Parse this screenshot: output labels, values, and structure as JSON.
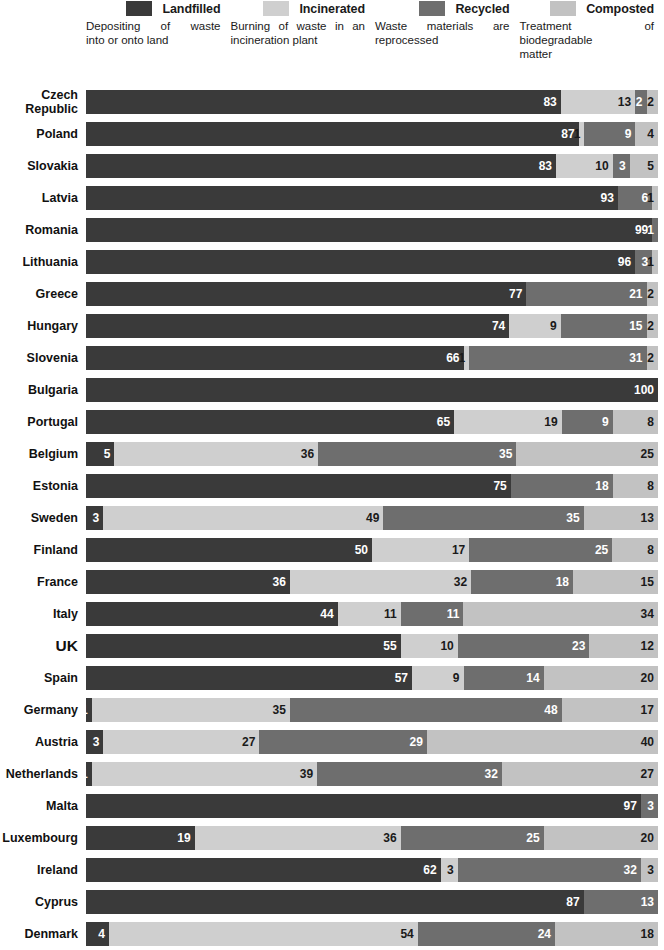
{
  "legend": {
    "items": [
      {
        "key": "landfilled",
        "label": "Landfilled",
        "color": "#3a3a3a",
        "desc_lines": [
          "Depositing of waste",
          "into or onto land"
        ]
      },
      {
        "key": "incinerated",
        "label": "Incinerated",
        "color": "#cfcfcf",
        "desc_lines": [
          "Burning of waste in an",
          "incineration plant"
        ]
      },
      {
        "key": "recycled",
        "label": "Recycled",
        "color": "#6e6e6e",
        "desc_lines": [
          "Waste materials are",
          "reprocessed"
        ]
      },
      {
        "key": "composted",
        "label": "Composted",
        "color": "#c2c2c2",
        "desc_lines": [
          "Treatment of",
          "biodegradable",
          "matter"
        ]
      }
    ]
  },
  "chart_data": {
    "type": "bar",
    "orientation": "horizontal",
    "stacked": true,
    "title": "",
    "xlabel": "",
    "ylabel": "",
    "xlim": [
      0,
      100
    ],
    "unit": "percent",
    "grid": false,
    "legend_position": "top",
    "series": [
      {
        "name": "Landfilled",
        "color": "#3a3a3a"
      },
      {
        "name": "Incinerated",
        "color": "#cfcfcf"
      },
      {
        "name": "Recycled",
        "color": "#6e6e6e"
      },
      {
        "name": "Composted",
        "color": "#c2c2c2"
      }
    ],
    "categories": [
      "Czech Republic",
      "Poland",
      "Slovakia",
      "Latvia",
      "Romania",
      "Lithuania",
      "Greece",
      "Hungary",
      "Slovenia",
      "Bulgaria",
      "Portugal",
      "Belgium",
      "Estonia",
      "Sweden",
      "Finland",
      "France",
      "Italy",
      "UK",
      "Spain",
      "Germany",
      "Austria",
      "Netherlands",
      "Malta",
      "Luxembourg",
      "Ireland",
      "Cyprus",
      "Denmark"
    ],
    "rows": [
      {
        "label": "Czech\nRepublic",
        "emphasis": false,
        "segments": [
          {
            "series": "Landfilled",
            "value": 83
          },
          {
            "series": "Incinerated",
            "value": 13
          },
          {
            "series": "Recycled",
            "value": 2
          },
          {
            "series": "Composted",
            "value": 2
          }
        ]
      },
      {
        "label": "Poland",
        "emphasis": false,
        "segments": [
          {
            "series": "Landfilled",
            "value": 87
          },
          {
            "series": "Incinerated",
            "value": 1
          },
          {
            "series": "Recycled",
            "value": 9
          },
          {
            "series": "Composted",
            "value": 4
          }
        ]
      },
      {
        "label": "Slovakia",
        "emphasis": false,
        "segments": [
          {
            "series": "Landfilled",
            "value": 83
          },
          {
            "series": "Incinerated",
            "value": 10
          },
          {
            "series": "Recycled",
            "value": 3
          },
          {
            "series": "Composted",
            "value": 5
          }
        ]
      },
      {
        "label": "Latvia",
        "emphasis": false,
        "segments": [
          {
            "series": "Landfilled",
            "value": 93
          },
          {
            "series": "Recycled",
            "value": 6
          },
          {
            "series": "Composted",
            "value": 1
          }
        ]
      },
      {
        "label": "Romania",
        "emphasis": false,
        "segments": [
          {
            "series": "Landfilled",
            "value": 99
          },
          {
            "series": "Recycled",
            "value": 1
          }
        ]
      },
      {
        "label": "Lithuania",
        "emphasis": false,
        "segments": [
          {
            "series": "Landfilled",
            "value": 96
          },
          {
            "series": "Recycled",
            "value": 3
          },
          {
            "series": "Composted",
            "value": 1
          }
        ]
      },
      {
        "label": "Greece",
        "emphasis": false,
        "segments": [
          {
            "series": "Landfilled",
            "value": 77
          },
          {
            "series": "Recycled",
            "value": 21
          },
          {
            "series": "Composted",
            "value": 2
          }
        ]
      },
      {
        "label": "Hungary",
        "emphasis": false,
        "segments": [
          {
            "series": "Landfilled",
            "value": 74
          },
          {
            "series": "Incinerated",
            "value": 9
          },
          {
            "series": "Recycled",
            "value": 15
          },
          {
            "series": "Composted",
            "value": 2
          }
        ]
      },
      {
        "label": "Slovenia",
        "emphasis": false,
        "segments": [
          {
            "series": "Landfilled",
            "value": 66
          },
          {
            "series": "Incinerated",
            "value": 1
          },
          {
            "series": "Recycled",
            "value": 31
          },
          {
            "series": "Composted",
            "value": 2
          }
        ]
      },
      {
        "label": "Bulgaria",
        "emphasis": false,
        "segments": [
          {
            "series": "Landfilled",
            "value": 100
          }
        ]
      },
      {
        "label": "Portugal",
        "emphasis": false,
        "segments": [
          {
            "series": "Landfilled",
            "value": 65
          },
          {
            "series": "Incinerated",
            "value": 19
          },
          {
            "series": "Recycled",
            "value": 9
          },
          {
            "series": "Composted",
            "value": 8
          }
        ]
      },
      {
        "label": "Belgium",
        "emphasis": false,
        "segments": [
          {
            "series": "Landfilled",
            "value": 5
          },
          {
            "series": "Incinerated",
            "value": 36
          },
          {
            "series": "Recycled",
            "value": 35
          },
          {
            "series": "Composted",
            "value": 25
          }
        ]
      },
      {
        "label": "Estonia",
        "emphasis": false,
        "segments": [
          {
            "series": "Landfilled",
            "value": 75
          },
          {
            "series": "Recycled",
            "value": 18
          },
          {
            "series": "Composted",
            "value": 8
          }
        ]
      },
      {
        "label": "Sweden",
        "emphasis": false,
        "segments": [
          {
            "series": "Landfilled",
            "value": 3
          },
          {
            "series": "Incinerated",
            "value": 49
          },
          {
            "series": "Recycled",
            "value": 35
          },
          {
            "series": "Composted",
            "value": 13
          }
        ]
      },
      {
        "label": "Finland",
        "emphasis": false,
        "segments": [
          {
            "series": "Landfilled",
            "value": 50
          },
          {
            "series": "Incinerated",
            "value": 17
          },
          {
            "series": "Recycled",
            "value": 25
          },
          {
            "series": "Composted",
            "value": 8
          }
        ]
      },
      {
        "label": "France",
        "emphasis": false,
        "segments": [
          {
            "series": "Landfilled",
            "value": 36
          },
          {
            "series": "Incinerated",
            "value": 32
          },
          {
            "series": "Recycled",
            "value": 18
          },
          {
            "series": "Composted",
            "value": 15
          }
        ]
      },
      {
        "label": "Italy",
        "emphasis": false,
        "segments": [
          {
            "series": "Landfilled",
            "value": 44
          },
          {
            "series": "Incinerated",
            "value": 11
          },
          {
            "series": "Recycled",
            "value": 11
          },
          {
            "series": "Composted",
            "value": 34
          }
        ]
      },
      {
        "label": "UK",
        "emphasis": true,
        "segments": [
          {
            "series": "Landfilled",
            "value": 55
          },
          {
            "series": "Incinerated",
            "value": 10
          },
          {
            "series": "Recycled",
            "value": 23
          },
          {
            "series": "Composted",
            "value": 12
          }
        ]
      },
      {
        "label": "Spain",
        "emphasis": false,
        "segments": [
          {
            "series": "Landfilled",
            "value": 57
          },
          {
            "series": "Incinerated",
            "value": 9
          },
          {
            "series": "Recycled",
            "value": 14
          },
          {
            "series": "Composted",
            "value": 20
          }
        ]
      },
      {
        "label": "Germany",
        "emphasis": false,
        "segments": [
          {
            "series": "Landfilled",
            "value": 1
          },
          {
            "series": "Incinerated",
            "value": 35
          },
          {
            "series": "Recycled",
            "value": 48
          },
          {
            "series": "Composted",
            "value": 17
          }
        ]
      },
      {
        "label": "Austria",
        "emphasis": false,
        "segments": [
          {
            "series": "Landfilled",
            "value": 3
          },
          {
            "series": "Incinerated",
            "value": 27
          },
          {
            "series": "Recycled",
            "value": 29
          },
          {
            "series": "Composted",
            "value": 40
          }
        ]
      },
      {
        "label": "Netherlands",
        "emphasis": false,
        "segments": [
          {
            "series": "Landfilled",
            "value": 1
          },
          {
            "series": "Incinerated",
            "value": 39
          },
          {
            "series": "Recycled",
            "value": 32
          },
          {
            "series": "Composted",
            "value": 27
          }
        ]
      },
      {
        "label": "Malta",
        "emphasis": false,
        "segments": [
          {
            "series": "Landfilled",
            "value": 97
          },
          {
            "series": "Recycled",
            "value": 3
          }
        ]
      },
      {
        "label": "Luxembourg",
        "emphasis": false,
        "segments": [
          {
            "series": "Landfilled",
            "value": 19
          },
          {
            "series": "Incinerated",
            "value": 36
          },
          {
            "series": "Recycled",
            "value": 25
          },
          {
            "series": "Composted",
            "value": 20
          }
        ]
      },
      {
        "label": "Ireland",
        "emphasis": false,
        "segments": [
          {
            "series": "Landfilled",
            "value": 62
          },
          {
            "series": "Incinerated",
            "value": 3
          },
          {
            "series": "Recycled",
            "value": 32
          },
          {
            "series": "Composted",
            "value": 3
          }
        ]
      },
      {
        "label": "Cyprus",
        "emphasis": false,
        "segments": [
          {
            "series": "Landfilled",
            "value": 87
          },
          {
            "series": "Recycled",
            "value": 13
          }
        ]
      },
      {
        "label": "Denmark",
        "emphasis": false,
        "segments": [
          {
            "series": "Landfilled",
            "value": 4
          },
          {
            "series": "Incinerated",
            "value": 54
          },
          {
            "series": "Recycled",
            "value": 24
          },
          {
            "series": "Composted",
            "value": 18
          }
        ]
      }
    ]
  }
}
